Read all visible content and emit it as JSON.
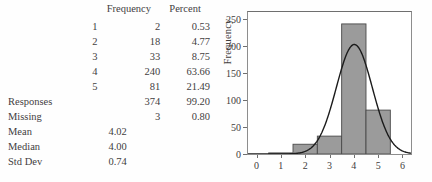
{
  "table": {
    "headers": {
      "label": "",
      "frequency": "Frequency",
      "percent": "Percent"
    },
    "rows": [
      {
        "label": "1",
        "frequency": "2",
        "percent": "0.53"
      },
      {
        "label": "2",
        "frequency": "18",
        "percent": "4.77"
      },
      {
        "label": "3",
        "frequency": "33",
        "percent": "8.75"
      },
      {
        "label": "4",
        "frequency": "240",
        "percent": "63.66"
      },
      {
        "label": "5",
        "frequency": "81",
        "percent": "21.49"
      }
    ],
    "totals": [
      {
        "label": "Responses",
        "frequency": "374",
        "percent": "99.20"
      },
      {
        "label": "Missing",
        "frequency": "3",
        "percent": "0.80"
      }
    ],
    "stats": [
      {
        "label": "Mean",
        "value": "4.02"
      },
      {
        "label": "Median",
        "value": "4.00"
      },
      {
        "label": "Std Dev",
        "value": "0.74"
      }
    ]
  },
  "chart_data": {
    "type": "bar",
    "title": "",
    "xlabel": "",
    "ylabel": "Frequency",
    "xlim": [
      -0.35,
      6.35
    ],
    "ylim": [
      0,
      262
    ],
    "grid": false,
    "legend": false,
    "x_ticks": [
      "0",
      "1",
      "2",
      "3",
      "4",
      "5",
      "6"
    ],
    "x_tick_values": [
      0,
      1,
      2,
      3,
      4,
      5,
      6
    ],
    "y_ticks": [
      "0",
      "50",
      "100",
      "150",
      "200",
      "250"
    ],
    "y_tick_values": [
      0,
      50,
      100,
      150,
      200,
      250
    ],
    "categories": [
      "1",
      "2",
      "3",
      "4",
      "5"
    ],
    "values": [
      2,
      18,
      33,
      240,
      81
    ],
    "bin_width": 1,
    "bin_edges": [
      0.5,
      1.5,
      2.5,
      3.5,
      4.5,
      5.5
    ],
    "bar_color": "#9b9b9b",
    "bar_edge_color": "#4a4a4a",
    "overlay": {
      "type": "line",
      "name": "normal-curve",
      "color": "#1c1c1c",
      "mean": 4.02,
      "std_dev": 0.74,
      "peak_value": 202
    }
  }
}
